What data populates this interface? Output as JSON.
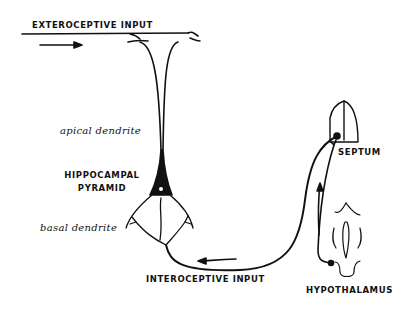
{
  "diagram": {
    "labels": {
      "exteroceptive_input": "EXTEROCEPTIVE  INPUT",
      "apical_dendrite": "apical dendrite",
      "hippocampal": "HIPPOCAMPAL",
      "pyramid": "PYRAMID",
      "basal_dendrite": "basal dendrite",
      "interoceptive_input": "INTEROCEPTIVE  INPUT",
      "septum": "SEPTUM",
      "hypothalamus": "HYPOTHALAMUS"
    },
    "colors": {
      "ink": "#111111",
      "background": "#ffffff"
    }
  }
}
